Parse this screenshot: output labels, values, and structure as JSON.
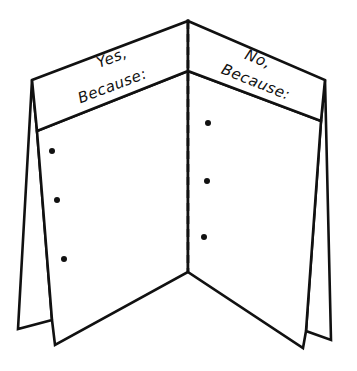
{
  "diagram": {
    "type": "foldable-two-flap-organizer",
    "left_flap": {
      "heading_line1": "Yes,",
      "heading_line2": "Because:",
      "bullet_count": 3
    },
    "right_flap": {
      "heading_line1": "No,",
      "heading_line2": "Because:",
      "bullet_count": 3
    },
    "center_fold": "dashed",
    "colors": {
      "stroke": "#111111",
      "background": "#ffffff"
    }
  }
}
